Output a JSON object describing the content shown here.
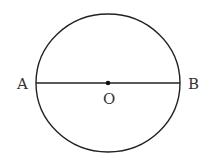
{
  "diagram": {
    "type": "circle-with-diameter",
    "points": {
      "left": {
        "label": "A"
      },
      "right": {
        "label": "B"
      },
      "center": {
        "label": "O"
      }
    },
    "colors": {
      "stroke": "#222222",
      "text": "#333333",
      "background": "#ffffff"
    }
  }
}
